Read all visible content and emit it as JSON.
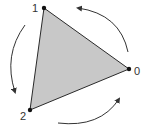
{
  "diagram": {
    "type": "rotation-of-triangle",
    "triangle": {
      "fill": "#c8c8c8",
      "stroke": "#2a2a2a",
      "vertices": [
        {
          "id": "0",
          "label": "0",
          "x": 129,
          "y": 69
        },
        {
          "id": "1",
          "label": "1",
          "x": 44,
          "y": 8
        },
        {
          "id": "2",
          "label": "2",
          "x": 30,
          "y": 110
        }
      ]
    },
    "arrows": [
      {
        "name": "arrow-0-to-1",
        "direction": "counter-clockwise",
        "from": "0",
        "to": "1"
      },
      {
        "name": "arrow-1-to-2",
        "direction": "counter-clockwise",
        "from": "1",
        "to": "2"
      },
      {
        "name": "arrow-2-to-0",
        "direction": "counter-clockwise",
        "from": "2",
        "to": "0"
      }
    ],
    "arrow_color": "#333333"
  },
  "labels": {
    "v0": "0",
    "v1": "1",
    "v2": "2"
  }
}
